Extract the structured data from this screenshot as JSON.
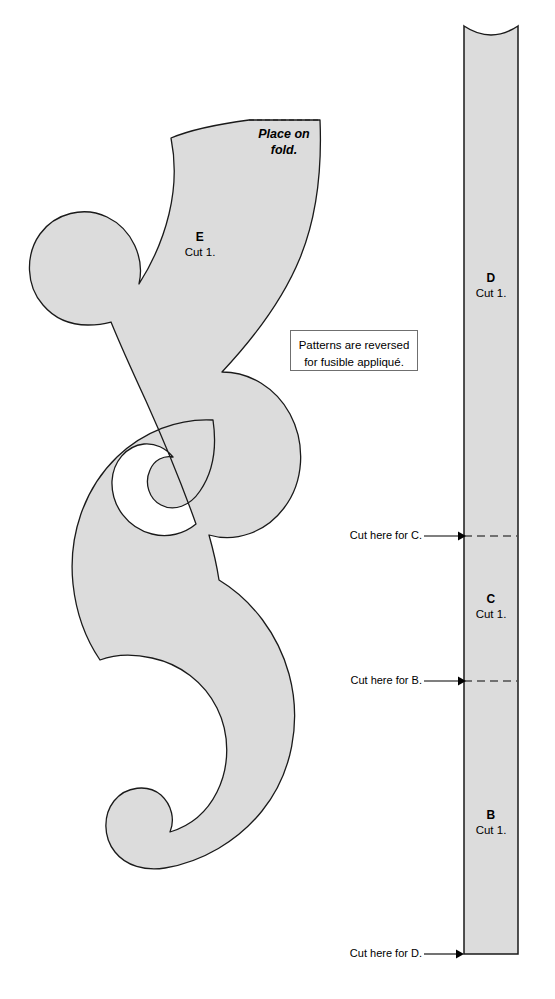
{
  "document": {
    "title": "Appliqué Pattern Sheet",
    "background_color": "#ffffff",
    "piece_fill_color": "#dcdcdc",
    "piece_outline_color": "#1a1a1a",
    "cut_line_color": "#4d4d4d"
  },
  "note": {
    "line1": "Patterns are reversed",
    "line2": "for fusible appliqué."
  },
  "swirl_piece": {
    "letter": "E",
    "cut": "Cut 1.",
    "fold_line1": "Place on",
    "fold_line2": "fold."
  },
  "strip_piece": {
    "segments": [
      {
        "letter": "D",
        "cut": "Cut 1."
      },
      {
        "letter": "C",
        "cut": "Cut 1."
      },
      {
        "letter": "B",
        "cut": "Cut 1."
      }
    ],
    "cut_marks": [
      {
        "label": "Cut here for C."
      },
      {
        "label": "Cut here for B."
      },
      {
        "label": "Cut here for D."
      }
    ]
  }
}
